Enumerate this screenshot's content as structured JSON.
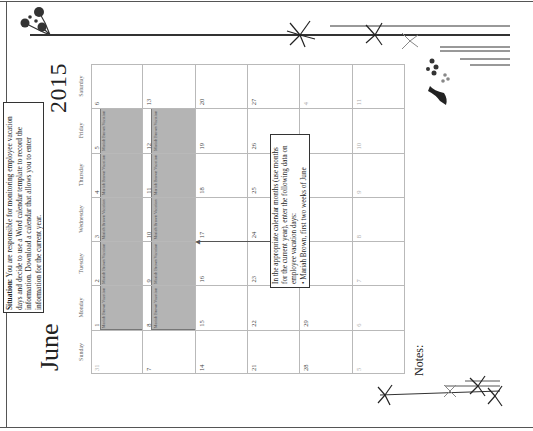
{
  "page": {
    "month": "June",
    "year": "2015",
    "situation": {
      "label": "Situation:",
      "text": " You are responsible for monitoring employee vacation days and decide to use a Word calendar template to record the information. Download a calendar that allows you to enter information for the current year."
    },
    "callout": {
      "intro": "In the appropriate calendar months (use months for the current year), enter the following data on employee vacation days:",
      "bullet": "• Mariah Brown, first two weeks of June"
    },
    "notes_label": "Notes:",
    "colors": {
      "vacation_fill": "#b4b4b4",
      "grid_line": "#b9b9b9",
      "text": "#222222"
    }
  },
  "calendar": {
    "weekdays": [
      "Sunday",
      "Monday",
      "Tuesday",
      "Wednesday",
      "Thursday",
      "Friday",
      "Saturday"
    ],
    "weeks": [
      [
        {
          "day": "31",
          "other": true,
          "event": ""
        },
        {
          "day": "1",
          "event": "Mariah Brown Vacation"
        },
        {
          "day": "2",
          "event": "Mariah Brown Vacation"
        },
        {
          "day": "3",
          "event": "Mariah Brown Vacation"
        },
        {
          "day": "4",
          "event": "Mariah Brown Vacation"
        },
        {
          "day": "5",
          "event": "Mariah Brown Vacation"
        },
        {
          "day": "6",
          "event": ""
        }
      ],
      [
        {
          "day": "7",
          "event": ""
        },
        {
          "day": "8",
          "event": "Mariah Brown Vacation"
        },
        {
          "day": "9",
          "event": "Mariah Brown Vacation"
        },
        {
          "day": "10",
          "event": "Mariah Brown Vacation"
        },
        {
          "day": "11",
          "event": "Mariah Brown Vacation"
        },
        {
          "day": "12",
          "event": "Mariah Brown Vacation"
        },
        {
          "day": "13",
          "event": ""
        }
      ],
      [
        {
          "day": "14",
          "event": ""
        },
        {
          "day": "15",
          "event": ""
        },
        {
          "day": "16",
          "event": ""
        },
        {
          "day": "17",
          "event": ""
        },
        {
          "day": "18",
          "event": ""
        },
        {
          "day": "19",
          "event": ""
        },
        {
          "day": "20",
          "event": ""
        }
      ],
      [
        {
          "day": "21",
          "event": ""
        },
        {
          "day": "22",
          "event": ""
        },
        {
          "day": "23",
          "event": ""
        },
        {
          "day": "24",
          "event": ""
        },
        {
          "day": "25",
          "event": ""
        },
        {
          "day": "26",
          "event": ""
        },
        {
          "day": "27",
          "event": ""
        }
      ],
      [
        {
          "day": "28",
          "event": ""
        },
        {
          "day": "29",
          "event": ""
        },
        {
          "day": "30",
          "event": ""
        },
        {
          "day": "1",
          "other": true,
          "event": ""
        },
        {
          "day": "2",
          "other": true,
          "event": ""
        },
        {
          "day": "3",
          "other": true,
          "event": ""
        },
        {
          "day": "4",
          "other": true,
          "event": ""
        }
      ],
      [
        {
          "day": "5",
          "other": true,
          "event": ""
        },
        {
          "day": "6",
          "other": true,
          "event": ""
        },
        {
          "day": "7",
          "other": true,
          "event": ""
        },
        {
          "day": "8",
          "other": true,
          "event": ""
        },
        {
          "day": "9",
          "other": true,
          "event": ""
        },
        {
          "day": "10",
          "other": true,
          "event": ""
        },
        {
          "day": "11",
          "other": true,
          "event": ""
        }
      ]
    ]
  }
}
